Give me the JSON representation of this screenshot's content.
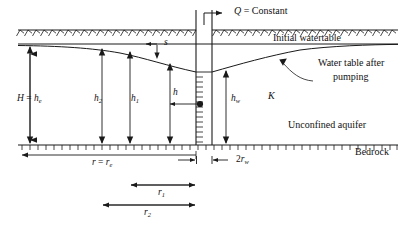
{
  "figure": {
    "type": "hydrogeology-cross-section",
    "title_visible": false,
    "line_color": "#1a1a1a",
    "background": "#ffffff"
  },
  "labels": {
    "discharge": {
      "symbol": "Q",
      "equals": " = Constant",
      "full": "Q = Constant"
    },
    "initial_watertable": "Initial watertable",
    "pumped_watertable_line1": "Water table after",
    "pumped_watertable_line2": "pumping",
    "unconfined_aquifer": "Unconfined aquifer",
    "bedrock": "Bedrock",
    "hydraulic_conductivity": "K",
    "drawdown": "s",
    "aquifer_thickness": {
      "sym1": "H",
      "eq": " = ",
      "sym2": "h",
      "sub2": "e",
      "full": "H = he"
    },
    "head_h2": {
      "sym": "h",
      "sub": "2",
      "full": "h2"
    },
    "head_h1": {
      "sym": "h",
      "sub": "1",
      "full": "h1"
    },
    "head_h": {
      "sym": "h",
      "sub": "",
      "full": "h"
    },
    "head_hw": {
      "sym": "h",
      "sub": "w",
      "full": "hw"
    },
    "radius_re": {
      "sym1": "r",
      "eq": " = ",
      "sym2": "r",
      "sub2": "e",
      "full": "r = re"
    },
    "radius_r1": {
      "sym": "r",
      "sub": "1",
      "full": "r1"
    },
    "radius_r2": {
      "sym": "r",
      "sub": "2",
      "full": "r2"
    },
    "well_radius": {
      "prefix": "2",
      "sym": "r",
      "sub": "w",
      "full": "2rw"
    }
  },
  "geometry": {
    "ground_surface_y": 30,
    "initial_watertable_y": 44,
    "bedrock_y": 145,
    "well_left_x": 196,
    "well_right_x": 212,
    "well_center_x": 204,
    "diagram_left_x": 18,
    "diagram_right_x": 398
  },
  "dimension_lines": [
    {
      "name": "r = re",
      "x_start": 18,
      "x_end": 196,
      "y": 155
    },
    {
      "name": "2rw",
      "x_start": 196,
      "x_end": 212,
      "y": 159
    },
    {
      "name": "r1",
      "x_start": 130,
      "x_end": 196,
      "y": 185
    },
    {
      "name": "r2",
      "x_start": 102,
      "x_end": 196,
      "y": 205
    }
  ],
  "head_arrows": [
    {
      "name": "H = he",
      "x": 30,
      "y_top": 46,
      "y_bottom": 144
    },
    {
      "name": "h2",
      "x": 102,
      "y_top": 48,
      "y_bottom": 144
    },
    {
      "name": "h1",
      "x": 130,
      "y_top": 51,
      "y_bottom": 144
    },
    {
      "name": "h",
      "x": 170,
      "y_top": 63,
      "y_bottom": 144
    },
    {
      "name": "hw",
      "x": 226,
      "y_top": 70,
      "y_bottom": 144
    }
  ]
}
